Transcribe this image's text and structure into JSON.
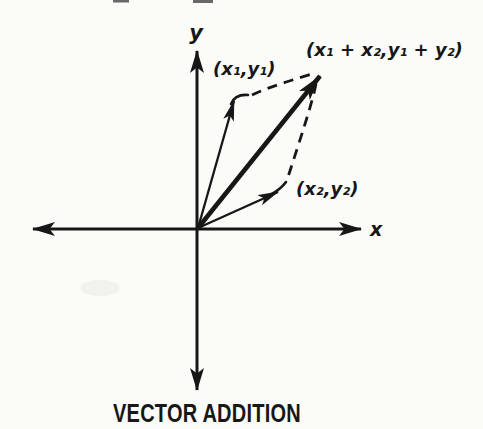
{
  "figure": {
    "caption": "VECTOR ADDITION",
    "axes": {
      "x_label": "x",
      "y_label": "y"
    },
    "points": {
      "v1_label": "(x₁,y₁)",
      "v2_label": "(x₂,y₂)",
      "sum_label": "(x₁ + x₂,y₁ + y₂)"
    },
    "vectors": [
      {
        "name": "vector-1",
        "endpoint_label": "(x₁,y₁)",
        "style": "thin solid arrow"
      },
      {
        "name": "vector-2",
        "endpoint_label": "(x₂,y₂)",
        "style": "thin solid arrow"
      },
      {
        "name": "resultant",
        "endpoint_label": "(x₁ + x₂,y₁ + y₂)",
        "style": "thick solid arrow"
      }
    ],
    "construction_lines": "dashed parallelogram sides",
    "colors": {
      "ink": "#171717",
      "background": "#fbfbf8"
    }
  }
}
